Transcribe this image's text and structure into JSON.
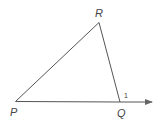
{
  "diagram": {
    "type": "triangle-exterior-angle",
    "vertices": {
      "P": {
        "label": "P",
        "x": 15.5,
        "y": 101.5
      },
      "Q": {
        "label": "Q",
        "x": 120,
        "y": 102
      },
      "R": {
        "label": "R",
        "x": 99,
        "y": 22.5
      }
    },
    "ray": {
      "from": "Q",
      "tip_x": 152,
      "tip_y": 102
    },
    "angle_label": "1",
    "colors": {
      "stroke": "#555555",
      "text": "#444444"
    }
  }
}
